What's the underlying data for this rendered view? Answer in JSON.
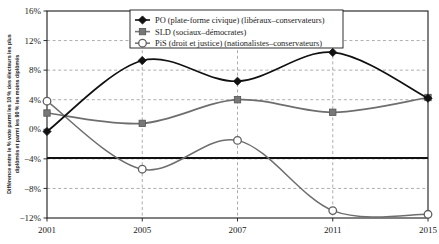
{
  "chart_data": {
    "type": "line",
    "title": "",
    "xlabel": "",
    "ylabel": "Différence entre le % vote parmi les 10 % des électeurs les plus diplômés et parmi les 90 % les moins diplômés",
    "ylabel_line1": "Différence entre le % vote parmi les 10 % des électeurs les plus",
    "ylabel_line2": "diplômés et parmi les 90 % les moins diplômés",
    "x": [
      2001,
      2005,
      2007,
      2011,
      2015
    ],
    "x_tick_labels": [
      "2001",
      "2005",
      "2007",
      "2011",
      "2015"
    ],
    "y_tick_labels": [
      "16%",
      "12%",
      "8%",
      "4%",
      "0%",
      "−4%",
      "−8%",
      "−12%"
    ],
    "y_tick_values": [
      16,
      12,
      8,
      4,
      0,
      -4,
      -8,
      -12
    ],
    "ylim": [
      -12,
      16
    ],
    "xlim": [
      2001,
      2015
    ],
    "grid": true,
    "legend_position": "top-center",
    "series": [
      {
        "name": "PO (plate-forme civique) (libéraux–conservateurs)",
        "short": "PO",
        "marker": "diamond",
        "color": "#111111",
        "values": [
          -0.3,
          9.3,
          6.5,
          10.4,
          4.2
        ]
      },
      {
        "name": "SLD (sociaux–démocrates)",
        "short": "SLD",
        "marker": "square",
        "color": "#777777",
        "values": [
          2.2,
          0.8,
          4.0,
          2.3,
          4.3
        ]
      },
      {
        "name": "PiS (droit et justice) (nationalistes–conservateurs)",
        "short": "PiS",
        "marker": "circle-open",
        "color": "#5f5f5f",
        "values": [
          3.8,
          -5.4,
          -1.5,
          -11.0,
          -11.5
        ]
      }
    ]
  },
  "legend": {
    "entries": [
      {
        "label": "PO (plate-forme civique) (libéraux–conservateurs)",
        "marker": "diamond"
      },
      {
        "label": "SLD (sociaux–démocrates)",
        "marker": "square"
      },
      {
        "label": "PiS (droit et justice) (nationalistes–conservateurs)",
        "marker": "circle-open"
      }
    ]
  },
  "colors": {
    "po": "#111111",
    "sld": "#777777",
    "pis": "#5f5f5f",
    "grid": "#8a8a8a",
    "axis": "#1a1a1a",
    "background": "#ffffff"
  }
}
